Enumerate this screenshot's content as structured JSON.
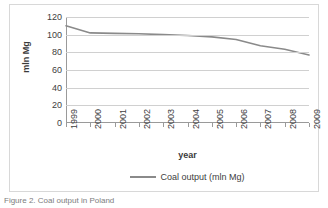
{
  "figure": {
    "caption": "Figure 2. Coal output in Poland"
  },
  "chart_data": {
    "type": "line",
    "title": "",
    "xlabel": "year",
    "ylabel": "mln Mg",
    "categories": [
      "1999",
      "2000",
      "2001",
      "2002",
      "2003",
      "2004",
      "2005",
      "2006",
      "2007",
      "2008",
      "2009"
    ],
    "series": [
      {
        "name": "Coal output (mln Mg)",
        "color": "#8a8a8a",
        "values": [
          110,
          102,
          101.5,
          101,
          100,
          99,
          97.5,
          94.5,
          87.5,
          83.5,
          77
        ]
      }
    ],
    "ylim": [
      0,
      120
    ],
    "ytick_values": [
      0,
      20,
      40,
      60,
      80,
      100,
      120
    ],
    "ytick_labels": [
      "0",
      "20",
      "40",
      "60",
      "80",
      "100",
      "120"
    ],
    "grid": true,
    "legend_position": "bottom"
  },
  "legend": {
    "entries": [
      {
        "label": "Coal output (mln Mg)",
        "swatch_name": "legend-line-swatch"
      }
    ]
  }
}
